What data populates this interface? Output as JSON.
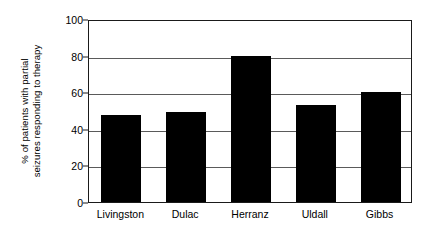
{
  "chart_data": {
    "type": "bar",
    "title": "",
    "xlabel": "",
    "ylabel_lines": [
      "% of patients with partial",
      "seizures responding to therapy"
    ],
    "ylabel": "% of patients with partial seizures responding to therapy",
    "categories": [
      "Livingston",
      "Dulac",
      "Herranz",
      "Uldall",
      "Gibbs"
    ],
    "values": [
      47.5,
      49,
      80,
      53,
      60
    ],
    "ylim": [
      0,
      100
    ],
    "yticks": [
      0,
      20,
      40,
      60,
      80,
      100
    ],
    "ytick_labels": [
      "0",
      "20",
      "40",
      "60",
      "80",
      "100"
    ],
    "grid": "horizontal",
    "legend": "none",
    "bar_color": "#000000",
    "axis_color": "#1a1a1a",
    "grid_color": "#5a5a5a",
    "background": "#ffffff"
  }
}
